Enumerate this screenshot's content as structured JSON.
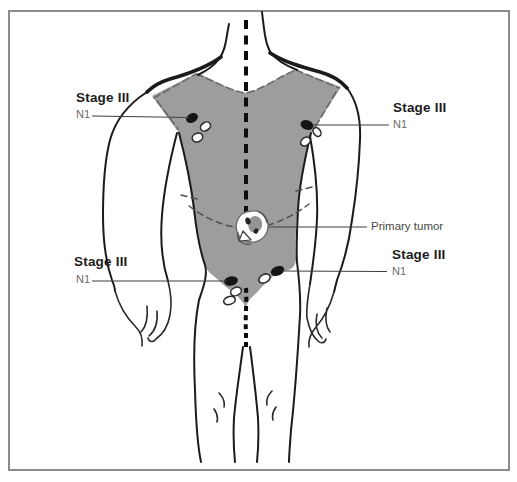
{
  "annotations": {
    "upper_left": {
      "stage_label": "Stage III",
      "node_label": "N1"
    },
    "upper_right": {
      "stage_label": "Stage III",
      "node_label": "N1"
    },
    "lower_left": {
      "stage_label": "Stage III",
      "node_label": "N1"
    },
    "lower_right": {
      "stage_label": "Stage III",
      "node_label": "N1"
    },
    "primary_tumor_label": "Primary tumor"
  },
  "colors": {
    "torso_fill": "#9d9d9d",
    "body_outline": "#1b1b1b",
    "midline": "#0d0d0d",
    "leader_line": "#3f3f3f",
    "stage_text": "#1c1c1c",
    "node_text": "#6a6a6a",
    "primary_tumor_text": "#474747",
    "frame_border": "#8c8c8c",
    "node_filled": "#141414",
    "node_open_stroke": "#2e2e2e"
  }
}
